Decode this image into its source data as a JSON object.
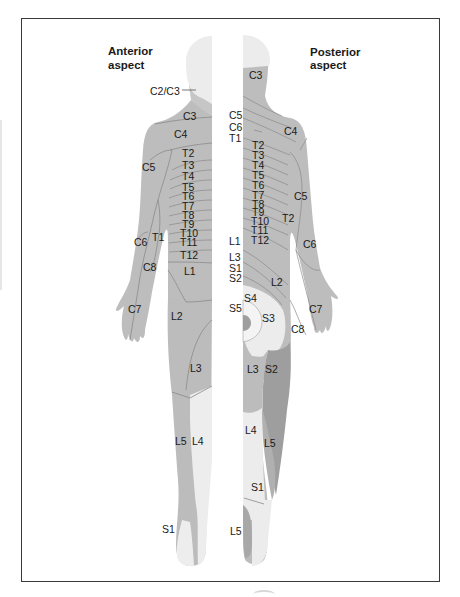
{
  "diagram": {
    "type": "dermatome-map",
    "colors": {
      "frame": "#3a3a3a",
      "skin_mid": "#b9b9b9",
      "skin_dark": "#9e9e9e",
      "skin_light": "#e9e9e9",
      "skin_lighter": "#f2f2f2",
      "line": "#8a8a8a",
      "text": "#1a1a1a"
    },
    "anterior": {
      "title_line1": "Anterior",
      "title_line2": "aspect",
      "labels": {
        "c2c3": "C2/C3",
        "c3": "C3",
        "c4": "C4",
        "c5": "C5",
        "t1": "T1",
        "c6": "C6",
        "c8": "C8",
        "c7": "C7",
        "t2": "T2",
        "t3": "T3",
        "t4": "T4",
        "t5": "T5",
        "t6": "T6",
        "t7": "T7",
        "t8": "T8",
        "t9": "T9",
        "t10": "T10",
        "t11": "T11",
        "t12": "T12",
        "l1": "L1",
        "l2": "L2",
        "l3": "L3",
        "l4": "L4",
        "l5": "L5",
        "s1": "S1"
      }
    },
    "posterior": {
      "title_line1": "Posterior",
      "title_line2": "aspect",
      "labels": {
        "c3": "C3",
        "c5_mid": "C5",
        "c6_mid": "C6",
        "t1_mid": "T1",
        "c4": "C4",
        "t2": "T2",
        "t3": "T3",
        "t4": "T4",
        "t5": "T5",
        "t6": "T6",
        "t7": "T7",
        "t8": "T8",
        "t9": "T9",
        "t10": "T10",
        "t11": "T11",
        "t12": "T12",
        "c5_arm": "C5",
        "t2_arm": "T2",
        "c6_arm": "C6",
        "l1_mid": "L1",
        "l3_mid": "L3",
        "s1_mid": "S1",
        "s2_mid": "S2",
        "l2": "L2",
        "s4": "S4",
        "s5": "S5",
        "s3": "S3",
        "c7": "C7",
        "c8": "C8",
        "l3": "L3",
        "s2": "S2",
        "l4": "L4",
        "l5": "L5",
        "s1": "S1",
        "l5_foot": "L5"
      }
    }
  }
}
